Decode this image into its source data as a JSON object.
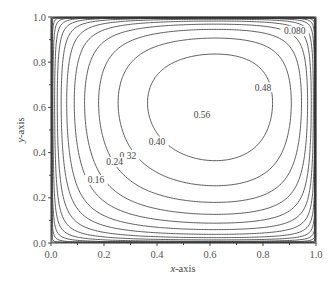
{
  "chart_data": {
    "type": "contour",
    "title": "",
    "xlabel": "x-axis",
    "ylabel": "y-axis",
    "xlim": [
      0.0,
      1.0
    ],
    "ylim": [
      0.0,
      1.0
    ],
    "x_ticks": [
      "0.0",
      "0.2",
      "0.4",
      "0.6",
      "0.8",
      "1.0"
    ],
    "y_ticks": [
      "0.0",
      "0.2",
      "0.4",
      "0.6",
      "0.8",
      "1.0"
    ],
    "grid": false,
    "legend": null,
    "field_maximum_location": {
      "x": 0.62,
      "y": 0.62
    },
    "contour_levels": [
      0.04,
      0.08,
      0.12,
      0.16,
      0.2,
      0.24,
      0.28,
      0.32,
      0.36,
      0.4,
      0.44,
      0.48,
      0.52,
      0.56
    ],
    "contour_labels": [
      {
        "text": "0.080",
        "x": 0.92,
        "y": 0.93
      },
      {
        "text": "0.48",
        "x": 0.8,
        "y": 0.68
      },
      {
        "text": "0.56",
        "x": 0.57,
        "y": 0.56
      },
      {
        "text": "0.40",
        "x": 0.4,
        "y": 0.44
      },
      {
        "text": "0.32",
        "x": 0.29,
        "y": 0.38
      },
      {
        "text": "0.24",
        "x": 0.24,
        "y": 0.35
      },
      {
        "text": "0.16",
        "x": 0.17,
        "y": 0.27
      }
    ]
  },
  "axes": {
    "x_title_italic": "x",
    "x_title_rest": "-axis",
    "y_title_italic": "y",
    "y_title_rest": "-axis"
  }
}
